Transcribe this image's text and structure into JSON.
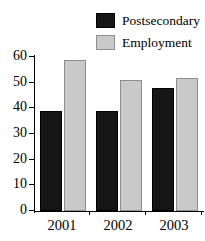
{
  "chart_data": {
    "type": "bar",
    "title": "",
    "subtitle": "",
    "xlabel": "",
    "ylabel": "",
    "categories": [
      "2001",
      "2002",
      "2003"
    ],
    "series": [
      {
        "name": "Postsecondary",
        "values": [
          39,
          39,
          48
        ],
        "color": "#161616"
      },
      {
        "name": "Employment",
        "values": [
          59,
          51,
          52
        ],
        "color": "#c9c9c9"
      }
    ],
    "ylim": [
      0,
      60
    ],
    "ytick_values": [
      0,
      10,
      20,
      30,
      40,
      50,
      60
    ],
    "ytick_labels": [
      "0",
      "10",
      "20",
      "30",
      "40",
      "50",
      "60"
    ],
    "grid": false,
    "legend_position": "top-right",
    "grouped": true
  },
  "legend": {
    "entries": [
      {
        "label": "Postsecondary",
        "color": "#161616"
      },
      {
        "label": "Employment",
        "color": "#c9c9c9"
      }
    ]
  },
  "axes": {
    "y_labels": [
      "60",
      "50",
      "40",
      "30",
      "20",
      "10",
      "0"
    ],
    "x_labels": [
      "2001",
      "2002",
      "2003"
    ]
  }
}
